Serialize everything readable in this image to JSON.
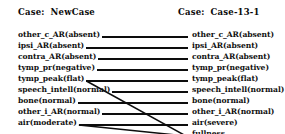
{
  "headers": {
    "left": {
      "keyword": "Case:",
      "value": "NewCase"
    },
    "right": {
      "keyword": "Case:",
      "value": "Case-13-1"
    }
  },
  "left_column": {
    "items": [
      {
        "label": "other_c_AR(absent)"
      },
      {
        "label": "ipsi_AR(absent)"
      },
      {
        "label": "contra_AR(absent)"
      },
      {
        "label": "tymp_pr(negative)"
      },
      {
        "label": "tymp_peak(flat)"
      },
      {
        "label": "speech_intell(normal)"
      },
      {
        "label": "bone(normal)"
      },
      {
        "label": "other_i_AR(normal)"
      },
      {
        "label": "air(moderate)"
      }
    ]
  },
  "right_column": {
    "items": [
      {
        "label": "other_c_AR(absent)"
      },
      {
        "label": "ipsi_AR(absent)"
      },
      {
        "label": "contra_AR(absent)"
      },
      {
        "label": "tymp_pr(negative)"
      },
      {
        "label": "tymp_peak(flat)"
      },
      {
        "label": "speech_intell(normal)"
      },
      {
        "label": "bone(normal)"
      },
      {
        "label": "other_i_AR(normal)"
      },
      {
        "label": "air(severe)"
      },
      {
        "label": "fullness"
      }
    ]
  },
  "connections": [
    {
      "from": "other_c_AR(absent)",
      "to": "other_c_AR(absent)",
      "kind": "straight"
    },
    {
      "from": "ipsi_AR(absent)",
      "to": "ipsi_AR(absent)",
      "kind": "straight"
    },
    {
      "from": "contra_AR(absent)",
      "to": "contra_AR(absent)",
      "kind": "straight"
    },
    {
      "from": "tymp_pr(negative)",
      "to": "tymp_pr(negative)",
      "kind": "straight"
    },
    {
      "from": "tymp_peak(flat)",
      "to": "tymp_peak(flat)",
      "kind": "straight"
    },
    {
      "from": "speech_intell(normal)",
      "to": "speech_intell(normal)",
      "kind": "straight"
    },
    {
      "from": "bone(normal)",
      "to": "bone(normal)",
      "kind": "straight"
    },
    {
      "from": "other_i_AR(normal)",
      "to": "other_i_AR(normal)",
      "kind": "straight"
    },
    {
      "from": "air(moderate)",
      "to": "air(severe)",
      "kind": "straight"
    },
    {
      "from": "tymp_peak(flat)",
      "to": "fullness",
      "kind": "diagonal"
    },
    {
      "from": "air(moderate)",
      "to": "fullness",
      "kind": "diagonal"
    }
  ],
  "colors": {
    "ink": "#0d0d0d",
    "background": "#ffffff"
  },
  "geometry": {
    "row_start_y": 37,
    "row_step": 11,
    "left_line_x_end": 190,
    "right_line_x_start": 188
  }
}
